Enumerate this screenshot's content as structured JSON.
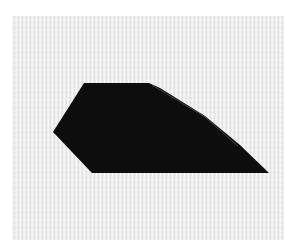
{
  "scene": {
    "description": "Black paper cutout polygon on textured white paper",
    "background_color": "#ffffff",
    "paper_color": "#ececec",
    "shape_color": "#0b0b0b",
    "shape_points": "84,83 149,83 160,88 205,116 240,145 269,173 92,173 53,132"
  }
}
